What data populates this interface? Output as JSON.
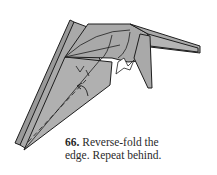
{
  "figure": {
    "type": "origami-diagram",
    "step_number": "66.",
    "caption_line1": "Reverse-fold the",
    "caption_line2": "edge. Repeat behind.",
    "colors": {
      "paper_fill": "#a9a9a9",
      "paper_dark": "#8c8c8c",
      "outline": "#1e1e1e",
      "background": "#ffffff"
    }
  }
}
